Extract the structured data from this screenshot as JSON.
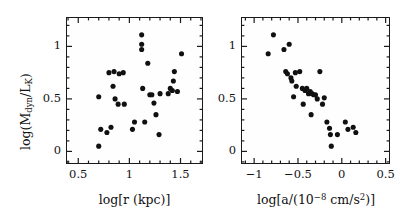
{
  "figure": {
    "background": "#ffffff",
    "marker_color": "#101010",
    "axis_color": "#1a1a1a"
  },
  "chart_data": [
    {
      "type": "scatter",
      "panel": "left",
      "title": "",
      "xlabel": "log[r (kpc)]",
      "ylabel": "log(M_dyn/L_K)",
      "xlim": [
        0.38,
        1.72
      ],
      "ylim": [
        -0.12,
        1.28
      ],
      "xticks": [
        0.5,
        1.0,
        1.5
      ],
      "xticklabels": [
        "0.5",
        "1",
        "1.5"
      ],
      "yticks": [
        0.0,
        0.5,
        1.0
      ],
      "yticklabels": [
        "0",
        "0.5",
        "1"
      ],
      "xminor_step": 0.1,
      "yminor_step": 0.1,
      "grid": false,
      "legend": "none",
      "x": [
        0.7,
        0.7,
        0.72,
        0.78,
        0.8,
        0.82,
        0.84,
        0.85,
        0.86,
        0.89,
        0.9,
        0.94,
        0.95,
        1.03,
        1.05,
        1.12,
        1.12,
        1.12,
        1.13,
        1.15,
        1.18,
        1.2,
        1.22,
        1.24,
        1.26,
        1.29,
        1.3,
        1.38,
        1.4,
        1.42,
        1.43,
        1.44,
        1.47,
        1.51
      ],
      "y": [
        0.52,
        0.05,
        0.21,
        0.18,
        0.75,
        0.23,
        0.62,
        0.76,
        0.5,
        0.45,
        0.74,
        0.75,
        0.45,
        0.21,
        0.28,
        1.11,
        1.02,
        0.97,
        0.6,
        0.28,
        0.84,
        0.54,
        0.54,
        0.46,
        0.35,
        0.16,
        0.55,
        0.55,
        0.6,
        0.58,
        0.67,
        0.76,
        0.57,
        0.93
      ]
    },
    {
      "type": "scatter",
      "panel": "right",
      "title": "",
      "xlabel": "log[a/(10^-8 cm/s^2)]",
      "ylabel": "log(M_dyn/L_K)",
      "xlim": [
        -1.15,
        0.55
      ],
      "ylim": [
        -0.12,
        1.28
      ],
      "xticks": [
        -1.0,
        -0.5,
        0.0,
        0.5
      ],
      "xticklabels": [
        "−1",
        "−0.5",
        "0",
        "0.5"
      ],
      "yticks": [
        0.0,
        0.5,
        1.0
      ],
      "yticklabels": [
        "0",
        "0.5",
        "1"
      ],
      "xminor_step": 0.1,
      "yminor_step": 0.1,
      "grid": false,
      "legend": "none",
      "x": [
        -0.84,
        -0.78,
        -0.66,
        -0.64,
        -0.62,
        -0.6,
        -0.58,
        -0.57,
        -0.55,
        -0.53,
        -0.52,
        -0.48,
        -0.45,
        -0.44,
        -0.42,
        -0.4,
        -0.38,
        -0.36,
        -0.35,
        -0.34,
        -0.32,
        -0.3,
        -0.28,
        -0.25,
        -0.22,
        -0.2,
        -0.17,
        -0.14,
        -0.13,
        -0.12,
        -0.05,
        0.04,
        0.07,
        0.13,
        0.16
      ],
      "y": [
        0.93,
        1.11,
        0.97,
        0.76,
        0.74,
        1.02,
        0.7,
        0.67,
        0.52,
        0.75,
        0.62,
        0.76,
        0.6,
        0.45,
        0.58,
        0.6,
        0.55,
        0.57,
        0.35,
        0.55,
        0.54,
        0.54,
        0.5,
        0.76,
        0.45,
        0.51,
        0.28,
        0.22,
        0.16,
        0.05,
        0.16,
        0.28,
        0.21,
        0.23,
        0.18
      ]
    }
  ],
  "labels": {
    "left_xlabel_parts": {
      "pre": "log[r (kpc)]"
    },
    "right_xlabel_parts": {
      "a": "log[a/(10",
      "exp": "−8",
      "b": " cm/s",
      "sup2": "2",
      "c": ")]"
    },
    "ylabel_parts": {
      "a": "log(M",
      "sub_dyn": "dyn",
      "b": "/L",
      "sub_k": "K",
      "c": ")"
    }
  }
}
